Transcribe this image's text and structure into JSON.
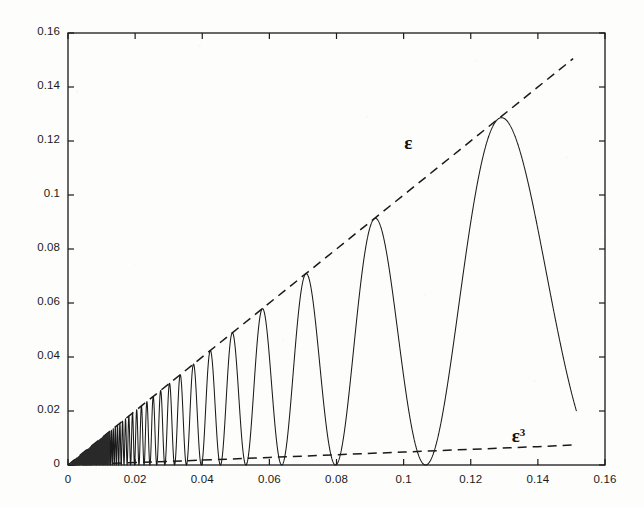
{
  "chart_data": {
    "type": "line",
    "title": "",
    "xlabel": "",
    "ylabel": "",
    "xlim": [
      0,
      0.16
    ],
    "ylim": [
      0,
      0.16
    ],
    "grid": false,
    "legend_position": "inline-annotations",
    "xticks": [
      "0",
      "0.02",
      "0.04",
      "0.06",
      "0.08",
      "0.1",
      "0.12",
      "0.14",
      "0.16"
    ],
    "xtick_values": [
      0,
      0.02,
      0.04,
      0.06,
      0.08,
      0.1,
      0.12,
      0.14,
      0.16
    ],
    "yticks": [
      "0",
      "0.02",
      "0.04",
      "0.06",
      "0.08",
      "0.1",
      "0.12",
      "0.14",
      "0.16"
    ],
    "ytick_values": [
      0,
      0.02,
      0.04,
      0.06,
      0.08,
      0.1,
      0.12,
      0.14,
      0.16
    ],
    "annotations": [
      {
        "text": "ε",
        "superscript": "",
        "x": 0.102,
        "y": 0.118,
        "name": "epsilon-label"
      },
      {
        "text": "ε",
        "superscript": "3",
        "x": 0.134,
        "y": 0.0095,
        "name": "epsilon-cubed-label"
      }
    ],
    "series": [
      {
        "name": "oscillation",
        "style": "solid",
        "color": "#1a1a1a",
        "description": "Oscillatory curve with linearly growing amplitude and lengthening period; peaks touch the epsilon envelope line.",
        "peaks_x": [
          0.0295,
          0.0335,
          0.0383,
          0.0443,
          0.0518,
          0.0578,
          0.0704,
          0.0912,
          0.1281
        ],
        "peaks_y": [
          0.0295,
          0.0335,
          0.0383,
          0.0443,
          0.0518,
          0.0578,
          0.0704,
          0.0925,
          0.131
        ],
        "zeros_x": [
          0.0315,
          0.0358,
          0.0412,
          0.0478,
          0.0548,
          0.0632,
          0.0793,
          0.1066
        ],
        "end_x": 0.1515,
        "end_y": 0.0245
      },
      {
        "name": "epsilon",
        "style": "dashed",
        "color": "#1a1a1a",
        "description": "Straight dashed envelope line y = epsilon",
        "x": [
          0.0,
          0.1505
        ],
        "y": [
          0.0,
          0.1505
        ]
      },
      {
        "name": "epsilon-cubed",
        "style": "dashed",
        "color": "#1a1a1a",
        "description": "Lower dashed curve y = epsilon^3 (scaled), nearly flat and very close to zero",
        "x": [
          0.0,
          0.02,
          0.04,
          0.06,
          0.08,
          0.1,
          0.12,
          0.14,
          0.1505
        ],
        "y": [
          0.0,
          0.0009,
          0.0018,
          0.0028,
          0.0038,
          0.0048,
          0.0058,
          0.0068,
          0.0074
        ]
      }
    ]
  },
  "axes": {
    "box": true,
    "tick_direction": "in",
    "ticks_all_sides": true,
    "line_color": "#1a1a1a"
  }
}
